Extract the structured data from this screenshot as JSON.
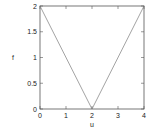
{
  "chart_data": {
    "type": "line",
    "title": "",
    "xlabel": "u",
    "ylabel": "f",
    "xlim": [
      0,
      4
    ],
    "ylim": [
      0,
      2
    ],
    "xticks": [
      0,
      1,
      2,
      3,
      4
    ],
    "yticks": [
      0,
      0.5,
      1,
      1.5,
      2
    ],
    "xtick_labels": [
      "0",
      "1",
      "2",
      "3",
      "4"
    ],
    "ytick_labels": [
      "0",
      "0.5",
      "1",
      "1.5",
      "2"
    ],
    "grid": false,
    "legend": null,
    "series": [
      {
        "name": "f(u)",
        "x": [
          0,
          2,
          4
        ],
        "y": [
          2,
          0,
          2
        ],
        "color": "#999999"
      }
    ]
  },
  "colors": {
    "frame": "#555555",
    "line": "#999999",
    "text": "#222222"
  }
}
